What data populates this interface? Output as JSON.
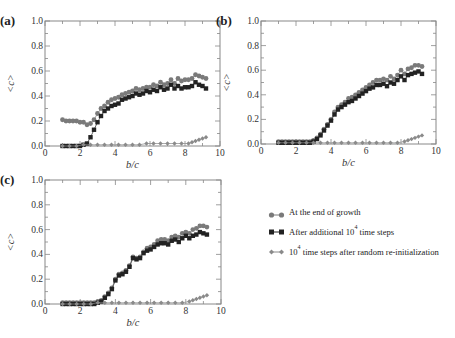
{
  "colors": {
    "growth": "#7a7a7a",
    "additional": "#222222",
    "reinit": "#8a8a8a",
    "axis": "#888888"
  },
  "legend": {
    "items": [
      {
        "marker": "circle",
        "label": "At the end of growth",
        "sup": ""
      },
      {
        "marker": "square",
        "label_pre": "After additional 10",
        "sup": "4",
        "label_post": " time steps"
      },
      {
        "marker": "diamond",
        "label_pre": "10",
        "sup": "4",
        "label_post": " time steps after random re-initialization"
      }
    ]
  },
  "chart_data": [
    {
      "panel": "(a)",
      "type": "scatter",
      "xlabel": "b/c",
      "ylabel": "<c>",
      "xlim": [
        0,
        10
      ],
      "ylim": [
        0,
        1
      ],
      "xticks": [
        0,
        2,
        4,
        6,
        8,
        10
      ],
      "yticks": [
        0.0,
        0.2,
        0.4,
        0.6,
        0.8,
        1.0
      ],
      "series": [
        {
          "name": "At the end of growth",
          "x": [
            1.0,
            1.2,
            1.4,
            1.6,
            1.8,
            2.0,
            2.2,
            2.4,
            2.6,
            2.8,
            3.0,
            3.2,
            3.4,
            3.6,
            3.8,
            4.0,
            4.2,
            4.4,
            4.6,
            4.8,
            5.0,
            5.2,
            5.4,
            5.6,
            5.8,
            6.0,
            6.2,
            6.4,
            6.6,
            6.8,
            7.0,
            7.2,
            7.4,
            7.6,
            7.8,
            8.0,
            8.2,
            8.4,
            8.6,
            8.8,
            9.0,
            9.2
          ],
          "y": [
            0.21,
            0.2,
            0.2,
            0.2,
            0.2,
            0.19,
            0.19,
            0.17,
            0.18,
            0.21,
            0.26,
            0.3,
            0.32,
            0.35,
            0.37,
            0.38,
            0.39,
            0.41,
            0.42,
            0.43,
            0.44,
            0.46,
            0.45,
            0.46,
            0.47,
            0.47,
            0.49,
            0.48,
            0.51,
            0.49,
            0.5,
            0.53,
            0.5,
            0.54,
            0.52,
            0.53,
            0.53,
            0.54,
            0.57,
            0.56,
            0.55,
            0.54
          ]
        },
        {
          "name": "After additional 10^4 time steps",
          "x": [
            1.0,
            1.2,
            1.4,
            1.6,
            1.8,
            2.0,
            2.2,
            2.4,
            2.6,
            2.8,
            3.0,
            3.2,
            3.4,
            3.6,
            3.8,
            4.0,
            4.2,
            4.4,
            4.6,
            4.8,
            5.0,
            5.2,
            5.4,
            5.6,
            5.8,
            6.0,
            6.2,
            6.4,
            6.6,
            6.8,
            7.0,
            7.2,
            7.4,
            7.6,
            7.8,
            8.0,
            8.2,
            8.4,
            8.6,
            8.8,
            9.0,
            9.2
          ],
          "y": [
            0.0,
            0.0,
            0.0,
            0.0,
            0.0,
            0.0,
            0.01,
            0.02,
            0.07,
            0.13,
            0.19,
            0.24,
            0.28,
            0.3,
            0.32,
            0.33,
            0.34,
            0.37,
            0.38,
            0.39,
            0.4,
            0.42,
            0.41,
            0.42,
            0.44,
            0.43,
            0.45,
            0.44,
            0.47,
            0.45,
            0.46,
            0.49,
            0.46,
            0.48,
            0.46,
            0.47,
            0.47,
            0.48,
            0.51,
            0.49,
            0.48,
            0.46
          ]
        },
        {
          "name": "10^4 time steps after random re-initialization",
          "x": [
            1.0,
            1.4,
            1.8,
            2.2,
            2.6,
            3.0,
            3.4,
            3.8,
            4.2,
            4.6,
            5.0,
            5.4,
            5.8,
            6.2,
            6.6,
            7.0,
            7.4,
            7.8,
            8.2,
            8.4,
            8.6,
            8.8,
            9.0,
            9.2
          ],
          "y": [
            0.0,
            0.0,
            0.0,
            0.01,
            0.01,
            0.01,
            0.01,
            0.01,
            0.01,
            0.01,
            0.01,
            0.01,
            0.02,
            0.02,
            0.02,
            0.02,
            0.02,
            0.02,
            0.02,
            0.03,
            0.04,
            0.05,
            0.06,
            0.07
          ]
        }
      ]
    },
    {
      "panel": "(b)",
      "type": "scatter",
      "xlabel": "b/c",
      "ylabel": "<c>",
      "xlim": [
        0,
        10
      ],
      "ylim": [
        0,
        1
      ],
      "xticks": [
        0,
        2,
        4,
        6,
        8,
        10
      ],
      "yticks": [
        0.0,
        0.2,
        0.4,
        0.6,
        0.8,
        1.0
      ],
      "series": [
        {
          "name": "At the end of growth",
          "x": [
            1.0,
            1.2,
            1.4,
            1.6,
            1.8,
            2.0,
            2.2,
            2.4,
            2.6,
            2.8,
            3.0,
            3.2,
            3.4,
            3.6,
            3.8,
            4.0,
            4.2,
            4.4,
            4.6,
            4.8,
            5.0,
            5.2,
            5.4,
            5.6,
            5.8,
            6.0,
            6.2,
            6.4,
            6.6,
            6.8,
            7.0,
            7.2,
            7.4,
            7.6,
            7.8,
            8.0,
            8.2,
            8.4,
            8.6,
            8.8,
            9.0,
            9.2
          ],
          "y": [
            0.02,
            0.02,
            0.02,
            0.02,
            0.02,
            0.02,
            0.02,
            0.02,
            0.02,
            0.02,
            0.03,
            0.05,
            0.08,
            0.12,
            0.16,
            0.2,
            0.26,
            0.3,
            0.32,
            0.34,
            0.37,
            0.38,
            0.4,
            0.42,
            0.44,
            0.46,
            0.48,
            0.5,
            0.52,
            0.52,
            0.53,
            0.52,
            0.55,
            0.53,
            0.56,
            0.6,
            0.57,
            0.61,
            0.62,
            0.64,
            0.64,
            0.63
          ]
        },
        {
          "name": "After additional 10^4 time steps",
          "x": [
            1.0,
            1.2,
            1.4,
            1.6,
            1.8,
            2.0,
            2.2,
            2.4,
            2.6,
            2.8,
            3.0,
            3.2,
            3.4,
            3.6,
            3.8,
            4.0,
            4.2,
            4.4,
            4.6,
            4.8,
            5.0,
            5.2,
            5.4,
            5.6,
            5.8,
            6.0,
            6.2,
            6.4,
            6.6,
            6.8,
            7.0,
            7.2,
            7.4,
            7.6,
            7.8,
            8.0,
            8.2,
            8.4,
            8.6,
            8.8,
            9.0,
            9.2
          ],
          "y": [
            0.01,
            0.01,
            0.01,
            0.01,
            0.01,
            0.01,
            0.01,
            0.01,
            0.01,
            0.01,
            0.02,
            0.04,
            0.07,
            0.11,
            0.15,
            0.19,
            0.24,
            0.28,
            0.3,
            0.32,
            0.34,
            0.35,
            0.37,
            0.39,
            0.41,
            0.43,
            0.45,
            0.46,
            0.48,
            0.48,
            0.49,
            0.47,
            0.5,
            0.49,
            0.52,
            0.55,
            0.52,
            0.56,
            0.57,
            0.58,
            0.59,
            0.57
          ]
        },
        {
          "name": "10^4 time steps after random re-initialization",
          "x": [
            1.0,
            1.4,
            1.8,
            2.2,
            2.6,
            3.0,
            3.4,
            3.8,
            4.2,
            4.6,
            5.0,
            5.4,
            5.8,
            6.2,
            6.6,
            7.0,
            7.4,
            7.8,
            8.2,
            8.4,
            8.6,
            8.8,
            9.0,
            9.2
          ],
          "y": [
            0.01,
            0.01,
            0.01,
            0.01,
            0.01,
            0.01,
            0.01,
            0.01,
            0.01,
            0.01,
            0.01,
            0.01,
            0.01,
            0.01,
            0.01,
            0.01,
            0.01,
            0.01,
            0.02,
            0.03,
            0.04,
            0.05,
            0.06,
            0.07
          ]
        }
      ]
    },
    {
      "panel": "(c)",
      "type": "scatter",
      "xlabel": "b/c",
      "ylabel": "<c>",
      "xlim": [
        0,
        10
      ],
      "ylim": [
        0,
        1
      ],
      "xticks": [
        0,
        2,
        4,
        6,
        8,
        10
      ],
      "yticks": [
        0.0,
        0.2,
        0.4,
        0.6,
        0.8,
        1.0
      ],
      "series": [
        {
          "name": "At the end of growth",
          "x": [
            1.0,
            1.2,
            1.4,
            1.6,
            1.8,
            2.0,
            2.2,
            2.4,
            2.6,
            2.8,
            3.0,
            3.2,
            3.4,
            3.6,
            3.8,
            4.0,
            4.2,
            4.4,
            4.6,
            4.8,
            5.0,
            5.2,
            5.4,
            5.6,
            5.8,
            6.0,
            6.2,
            6.4,
            6.6,
            6.8,
            7.0,
            7.2,
            7.4,
            7.6,
            7.8,
            8.0,
            8.2,
            8.4,
            8.6,
            8.8,
            9.0,
            9.2
          ],
          "y": [
            0.01,
            0.01,
            0.01,
            0.01,
            0.01,
            0.01,
            0.01,
            0.01,
            0.01,
            0.01,
            0.02,
            0.03,
            0.06,
            0.09,
            0.13,
            0.2,
            0.24,
            0.25,
            0.27,
            0.31,
            0.38,
            0.37,
            0.38,
            0.42,
            0.45,
            0.46,
            0.48,
            0.51,
            0.52,
            0.52,
            0.51,
            0.54,
            0.55,
            0.54,
            0.57,
            0.58,
            0.57,
            0.6,
            0.61,
            0.63,
            0.63,
            0.62
          ]
        },
        {
          "name": "After additional 10^4 time steps",
          "x": [
            1.0,
            1.2,
            1.4,
            1.6,
            1.8,
            2.0,
            2.2,
            2.4,
            2.6,
            2.8,
            3.0,
            3.2,
            3.4,
            3.6,
            3.8,
            4.0,
            4.2,
            4.4,
            4.6,
            4.8,
            5.0,
            5.2,
            5.4,
            5.6,
            5.8,
            6.0,
            6.2,
            6.4,
            6.6,
            6.8,
            7.0,
            7.2,
            7.4,
            7.6,
            7.8,
            8.0,
            8.2,
            8.4,
            8.6,
            8.8,
            9.0,
            9.2
          ],
          "y": [
            0.0,
            0.0,
            0.0,
            0.0,
            0.0,
            0.0,
            0.0,
            0.0,
            0.0,
            0.0,
            0.01,
            0.02,
            0.05,
            0.08,
            0.12,
            0.19,
            0.23,
            0.24,
            0.26,
            0.3,
            0.37,
            0.36,
            0.37,
            0.41,
            0.43,
            0.44,
            0.46,
            0.48,
            0.49,
            0.49,
            0.48,
            0.51,
            0.52,
            0.5,
            0.53,
            0.55,
            0.53,
            0.55,
            0.56,
            0.58,
            0.57,
            0.56
          ]
        },
        {
          "name": "10^4 time steps after random re-initialization",
          "x": [
            1.0,
            1.4,
            1.8,
            2.2,
            2.6,
            3.0,
            3.4,
            3.8,
            4.2,
            4.6,
            5.0,
            5.4,
            5.8,
            6.2,
            6.6,
            7.0,
            7.4,
            7.8,
            8.2,
            8.4,
            8.6,
            8.8,
            9.0,
            9.2
          ],
          "y": [
            0.0,
            0.0,
            0.0,
            0.0,
            0.0,
            0.01,
            0.01,
            0.01,
            0.01,
            0.01,
            0.01,
            0.01,
            0.01,
            0.01,
            0.01,
            0.01,
            0.01,
            0.01,
            0.02,
            0.03,
            0.04,
            0.05,
            0.06,
            0.07
          ]
        }
      ]
    }
  ]
}
